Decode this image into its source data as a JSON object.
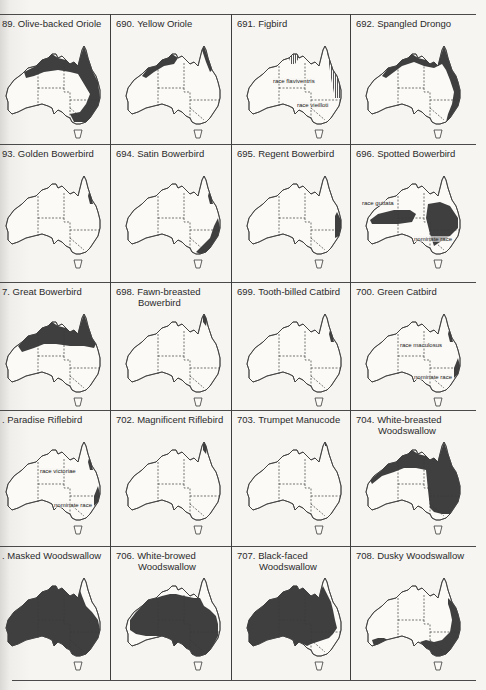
{
  "page": {
    "top_fragment": "",
    "grid": {
      "columns": 4,
      "rows": 5
    }
  },
  "colors": {
    "range_fill": "#3f3f3f",
    "outline": "#3a3a3a",
    "paper": "#f6f5f2",
    "grid_line": "#444444"
  },
  "species": [
    {
      "num": "89.",
      "name": "Olive-backed Oriole",
      "name2": "",
      "range": "north-east-arc",
      "labels": []
    },
    {
      "num": "690.",
      "name": "Yellow Oriole",
      "name2": "",
      "range": "north-coast",
      "labels": []
    },
    {
      "num": "691.",
      "name": "Figbird",
      "name2": "",
      "range": "hatched-north-east",
      "labels": [
        "race flaviventris",
        "race vieilloti"
      ]
    },
    {
      "num": "692.",
      "name": "Spangled Drongo",
      "name2": "",
      "range": "north-east-coast",
      "labels": []
    },
    {
      "num": "93.",
      "name": "Golden Bowerbird",
      "name2": "",
      "range": "ne-qld-patch",
      "labels": []
    },
    {
      "num": "694.",
      "name": "Satin Bowerbird",
      "name2": "",
      "range": "east-coast-south",
      "labels": []
    },
    {
      "num": "695.",
      "name": "Regent Bowerbird",
      "name2": "",
      "range": "central-east-coast",
      "labels": []
    },
    {
      "num": "696.",
      "name": "Spotted Bowerbird",
      "name2": "",
      "range": "two-blobs",
      "labels": [
        "race guttata",
        "nominate race"
      ]
    },
    {
      "num": "7.",
      "name": "Great Bowerbird",
      "name2": "",
      "range": "north-band",
      "labels": []
    },
    {
      "num": "698.",
      "name": "Fawn-breasted",
      "name2": "Bowerbird",
      "range": "cape-york-tip",
      "labels": []
    },
    {
      "num": "699.",
      "name": "Tooth-billed Catbird",
      "name2": "",
      "range": "ne-qld-patch",
      "labels": []
    },
    {
      "num": "700.",
      "name": "Green Catbird",
      "name2": "",
      "range": "two-east-patches",
      "labels": [
        "race maculosus",
        "nominate race"
      ]
    },
    {
      "num": ".",
      "name": "Paradise Riflebird",
      "name2": "",
      "range": "two-east-patches",
      "labels": [
        "race victoriae",
        "nominate race"
      ]
    },
    {
      "num": "702.",
      "name": "Magnificent Riflebird",
      "name2": "",
      "range": "cape-york-tip",
      "labels": []
    },
    {
      "num": "703.",
      "name": "Trumpet Manucode",
      "name2": "",
      "range": "cape-york-tiny",
      "labels": []
    },
    {
      "num": "704.",
      "name": "White-breasted",
      "name2": "Woodswallow",
      "range": "north-and-east",
      "labels": []
    },
    {
      "num": ".",
      "name": "Masked Woodswallow",
      "name2": "",
      "range": "most-except-ne",
      "labels": []
    },
    {
      "num": "706.",
      "name": "White-browed",
      "name2": "Woodswallow",
      "range": "most-except-sw-north",
      "labels": []
    },
    {
      "num": "707.",
      "name": "Black-faced",
      "name2": "Woodswallow",
      "range": "most-except-se",
      "labels": []
    },
    {
      "num": "708.",
      "name": "Dusky Woodswallow",
      "name2": "",
      "range": "east-and-south",
      "labels": []
    }
  ]
}
